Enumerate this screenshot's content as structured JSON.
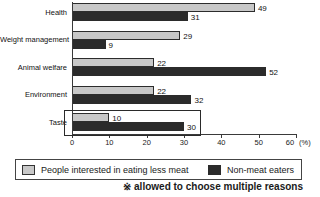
{
  "chart_data": {
    "type": "bar",
    "orientation": "horizontal",
    "categories": [
      "Health",
      "Weight management",
      "Animal welfare",
      "Environment",
      "Taste"
    ],
    "series": [
      {
        "name": "People interested in eating less meat",
        "color": "#c8c8c8",
        "values": [
          49,
          29,
          22,
          22,
          10
        ]
      },
      {
        "name": "Non-meat eaters",
        "color": "#2b2b2b",
        "values": [
          31,
          9,
          52,
          32,
          30
        ]
      }
    ],
    "xlim": [
      0,
      60
    ],
    "x_ticks": [
      "0",
      "10",
      "20",
      "30",
      "40",
      "50",
      "60"
    ],
    "x_unit_label": "(%)",
    "value_labels_shown": true,
    "highlighted_category": "Taste",
    "legend_position": "bottom",
    "grid": false,
    "note": "※ allowed to choose multiple reasons"
  }
}
